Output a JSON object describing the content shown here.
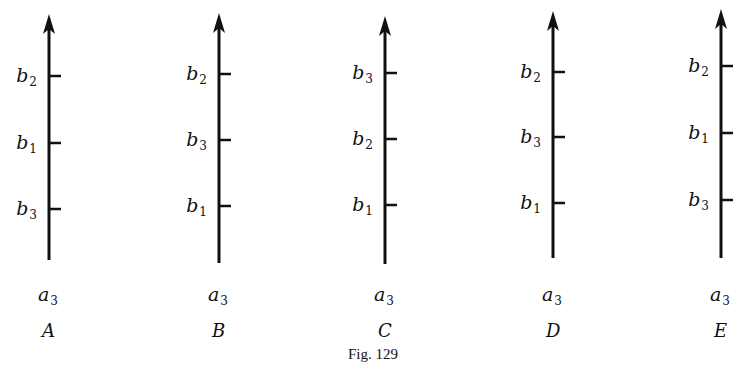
{
  "figure": {
    "caption": "Fig. 129",
    "panels": [
      {
        "id": "A",
        "letter": "A",
        "axis_label": "a",
        "axis_label_sub": "3",
        "axis_x": 49,
        "arrow_top": 14,
        "axis_bottom": 260,
        "ticks": [
          {
            "label": "b",
            "sub": "2",
            "y": 76
          },
          {
            "label": "b",
            "sub": "1",
            "y": 143
          },
          {
            "label": "b",
            "sub": "3",
            "y": 209
          }
        ]
      },
      {
        "id": "B",
        "letter": "B",
        "axis_label": "a",
        "axis_label_sub": "3",
        "axis_x": 219,
        "arrow_top": 13,
        "axis_bottom": 263,
        "ticks": [
          {
            "label": "b",
            "sub": "2",
            "y": 74
          },
          {
            "label": "b",
            "sub": "3",
            "y": 140
          },
          {
            "label": "b",
            "sub": "1",
            "y": 206
          }
        ]
      },
      {
        "id": "C",
        "letter": "C",
        "axis_label": "a",
        "axis_label_sub": "3",
        "axis_x": 385,
        "arrow_top": 16,
        "axis_bottom": 264,
        "ticks": [
          {
            "label": "b",
            "sub": "3",
            "y": 73
          },
          {
            "label": "b",
            "sub": "2",
            "y": 139
          },
          {
            "label": "b",
            "sub": "1",
            "y": 205
          }
        ]
      },
      {
        "id": "D",
        "letter": "D",
        "axis_label": "a",
        "axis_label_sub": "3",
        "axis_x": 553,
        "arrow_top": 11,
        "axis_bottom": 258,
        "ticks": [
          {
            "label": "b",
            "sub": "2",
            "y": 72
          },
          {
            "label": "b",
            "sub": "3",
            "y": 137
          },
          {
            "label": "b",
            "sub": "1",
            "y": 203
          }
        ]
      },
      {
        "id": "E",
        "letter": "E",
        "axis_label": "a",
        "axis_label_sub": "3",
        "axis_x": 721,
        "arrow_top": 9,
        "axis_bottom": 258,
        "ticks": [
          {
            "label": "b",
            "sub": "2",
            "y": 66
          },
          {
            "label": "b",
            "sub": "1",
            "y": 133
          },
          {
            "label": "b",
            "sub": "3",
            "y": 200
          }
        ]
      }
    ]
  }
}
